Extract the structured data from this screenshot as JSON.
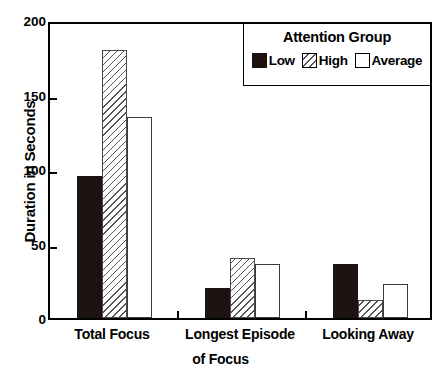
{
  "chart_data": {
    "type": "bar",
    "title": "",
    "subtitle": "",
    "xlabel": "of Focus",
    "ylabel": "Duration in Seconds",
    "ylim": [
      0,
      200
    ],
    "yticks": [
      0,
      50,
      100,
      150,
      200
    ],
    "ytick_labels": [
      "0",
      "50",
      "100",
      "150",
      "200"
    ],
    "grid": false,
    "legend_position": "top-right",
    "legend_title": "Attention Group",
    "categories": [
      "Total Focus",
      "Longest Episode",
      "Looking Away"
    ],
    "series": [
      {
        "name": "Low",
        "fill": "solid-black",
        "color": "#1c1310",
        "values": [
          95,
          20,
          36
        ]
      },
      {
        "name": "High",
        "fill": "diagonal-hatch",
        "color": "#ffffff",
        "values": [
          180,
          40,
          12
        ]
      },
      {
        "name": "Average",
        "fill": "white",
        "color": "#ffffff",
        "values": [
          135,
          36,
          23
        ]
      }
    ]
  },
  "axes": {
    "y_title": "Duration in Seconds",
    "x_title_line2": "of Focus"
  },
  "legend": {
    "title": "Attention Group",
    "entries": [
      {
        "label": "Low"
      },
      {
        "label": "High"
      },
      {
        "label": "Average"
      }
    ]
  },
  "colors": {
    "axis": "#000000",
    "low": "#1c1310",
    "high": "#ffffff",
    "average": "#ffffff",
    "hatch": "#555555",
    "background": "#ffffff"
  }
}
